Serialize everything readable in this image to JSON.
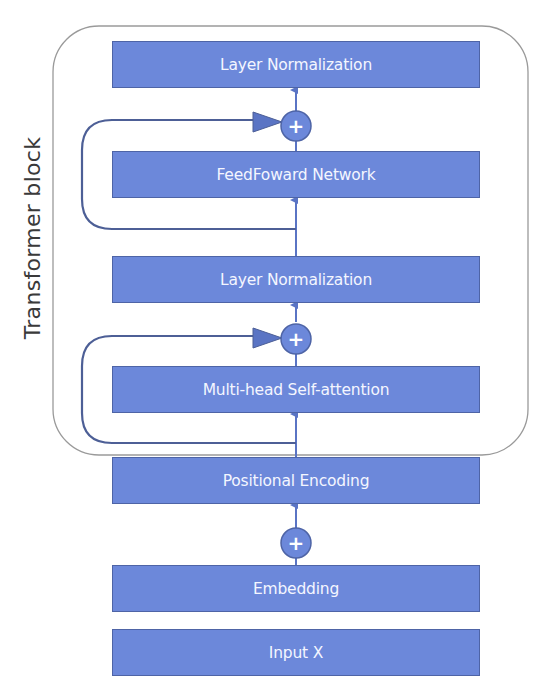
{
  "diagram": {
    "container_label": "Transformer block",
    "blocks": [
      {
        "id": "layer-norm-top",
        "label": "Layer Normalization"
      },
      {
        "id": "feedforward",
        "label": "FeedFoward Network"
      },
      {
        "id": "layer-norm-mid",
        "label": "Layer Normalization"
      },
      {
        "id": "multi-head-attention",
        "label": "Multi-head Self-attention"
      },
      {
        "id": "positional-encoding",
        "label": "Positional Encoding"
      },
      {
        "id": "embedding",
        "label": "Embedding"
      },
      {
        "id": "input",
        "label": "Input X"
      }
    ],
    "add_symbol": "+",
    "colors": {
      "block_fill": "#6c88da",
      "block_border": "#4e64a6",
      "arrow": "#5a74c4",
      "residual_line": "#4d5f96",
      "container_border": "#9a9a9a",
      "label_text": "#f4f6ff"
    }
  }
}
